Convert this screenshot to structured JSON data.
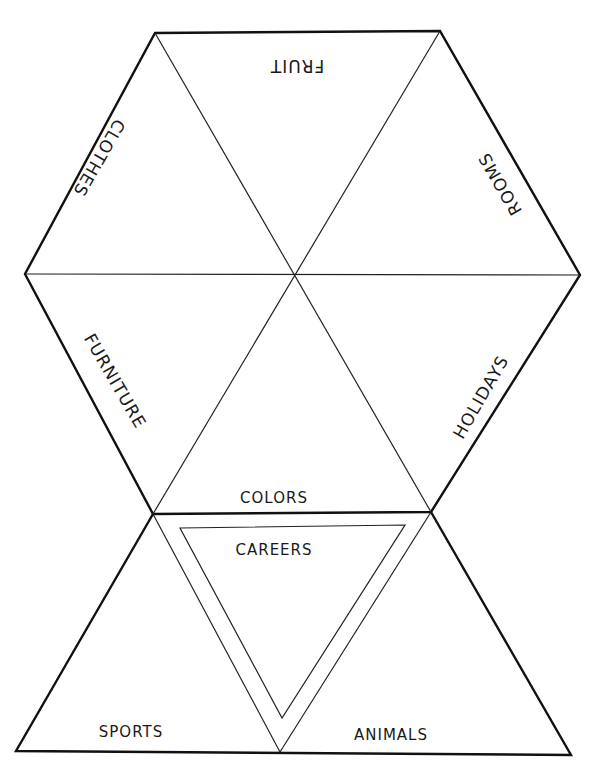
{
  "diagram": {
    "colors": {
      "line": "#111111",
      "background": "#ffffff",
      "text": "#1a1a1a"
    },
    "labels": {
      "fruit": "FRUIT",
      "clothes": "CLOTHES",
      "rooms": "ROOMS",
      "furniture": "FURNITURE",
      "holidays": "HOLIDAYS",
      "colors": "COLORS",
      "careers": "CAREERS",
      "sports": "SPORTS",
      "animals": "ANIMALS"
    }
  }
}
